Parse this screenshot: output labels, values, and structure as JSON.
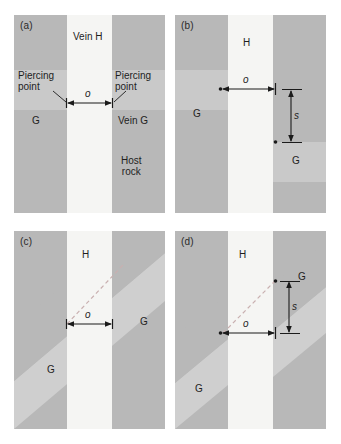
{
  "figure": {
    "background": "#ffffff",
    "width": 341,
    "height": 444
  },
  "colors": {
    "vein_light": "#f5f5f3",
    "host_rock": "#b8b8b8",
    "marker_band": "#c9c9c9",
    "marker_band_light": "#d4d4d2",
    "panel_bg": "#f2f2f0",
    "annotation": "#1b1b1b",
    "dashed_line": "#c9b0b0"
  },
  "panels": [
    {
      "id": "a",
      "tag": "(a)",
      "marker_style": "horizontal",
      "offset_present": false,
      "labels": {
        "vein_h": "Vein H",
        "vein_g": "Vein G",
        "g_left": "G",
        "host_rock": "Host\nrock",
        "piercing_left": "Piercing\npoint",
        "piercing_right": "Piercing\npoint",
        "offset_symbol": "o"
      }
    },
    {
      "id": "b",
      "tag": "(b)",
      "marker_style": "horizontal",
      "offset_present": true,
      "labels": {
        "vein_h": "H",
        "g_left": "G",
        "g_right": "G",
        "offset_symbol": "o",
        "separation_symbol": "s"
      }
    },
    {
      "id": "c",
      "tag": "(c)",
      "marker_style": "oblique",
      "offset_present": false,
      "labels": {
        "vein_h": "H",
        "g_left": "G",
        "g_right": "G",
        "offset_symbol": "o"
      }
    },
    {
      "id": "d",
      "tag": "(d)",
      "marker_style": "oblique",
      "offset_present": true,
      "labels": {
        "vein_h": "H",
        "g_left": "G",
        "g_right": "G",
        "offset_symbol": "o",
        "separation_symbol": "s"
      }
    }
  ]
}
